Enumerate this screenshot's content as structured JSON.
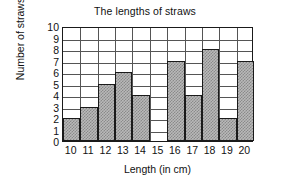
{
  "chart_data": {
    "type": "bar",
    "title": "The lengths of straws",
    "xlabel": "Length (in cm)",
    "ylabel": "Number of straws",
    "categories": [
      "10",
      "11",
      "12",
      "13",
      "14",
      "15",
      "16",
      "17",
      "18",
      "19",
      "20"
    ],
    "values": [
      2,
      3,
      5,
      6,
      4,
      0,
      7,
      4,
      8,
      2,
      7
    ],
    "series": [
      {
        "name": "Number of straws",
        "values": [
          2,
          3,
          5,
          6,
          4,
          0,
          7,
          4,
          8,
          2,
          7
        ]
      }
    ],
    "ylim": [
      0,
      10
    ],
    "ytick_labels": [
      "0",
      "1",
      "2",
      "3",
      "4",
      "5",
      "6",
      "7",
      "8",
      "9",
      "10"
    ],
    "ytick_values": [
      0,
      1,
      2,
      3,
      4,
      5,
      6,
      7,
      8,
      9,
      10
    ],
    "grid": true,
    "legend": "none",
    "bar_fill": "#b9b9b9",
    "bar_pattern": "checkerboard-stipple",
    "bar_edge_color": "#1a1a1a",
    "grid_color": "#555555",
    "background": "#ffffff"
  }
}
